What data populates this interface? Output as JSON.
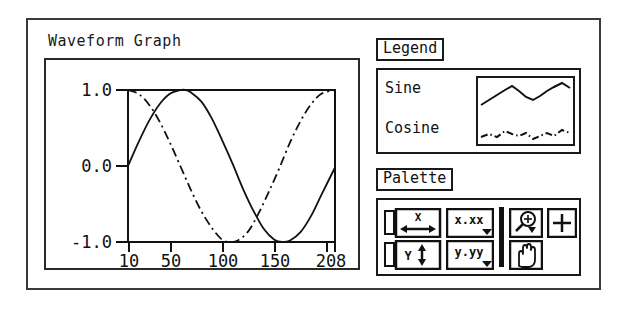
{
  "panel": {
    "background_color": "#ffffff",
    "border_color": "#3a3a3a"
  },
  "graph": {
    "title": "Waveform Graph"
  },
  "legend": {
    "tab_label": "Legend",
    "entries": [
      {
        "label": "Sine",
        "style": "solid"
      },
      {
        "label": "Cosine",
        "style": "dash-dot"
      }
    ]
  },
  "palette": {
    "tab_label": "Palette",
    "buttons": [
      {
        "name": "x-scale-lock",
        "label": "X",
        "icon": "x-horizontal-arrows-icon"
      },
      {
        "name": "x-format",
        "label": "x.xx",
        "icon": "x-format-dropdown-icon"
      },
      {
        "name": "zoom-tool",
        "label": "",
        "icon": "magnifier-plus-icon"
      },
      {
        "name": "cursor-tool",
        "label": "",
        "icon": "crosshair-icon"
      },
      {
        "name": "y-scale-lock",
        "label": "Y",
        "icon": "y-vertical-arrows-icon"
      },
      {
        "name": "y-format",
        "label": "y.yy",
        "icon": "y-format-dropdown-icon"
      },
      {
        "name": "pan-tool",
        "label": "",
        "icon": "hand-icon"
      }
    ]
  },
  "chart_data": {
    "type": "line",
    "title": "Waveform Graph",
    "xlabel": "",
    "ylabel": "",
    "xlim": [
      10,
      208
    ],
    "ylim": [
      -1.0,
      1.0
    ],
    "grid": false,
    "legend_position": "right",
    "xticks": [
      10,
      50,
      100,
      150,
      200,
      208
    ],
    "xtick_labels": [
      "10",
      "50",
      "100",
      "150",
      "208"
    ],
    "yticks": [
      -1.0,
      0.0,
      1.0
    ],
    "ytick_labels": [
      "1.0",
      "0.0",
      "-1.0"
    ],
    "series": [
      {
        "name": "Sine",
        "style": "solid",
        "x": [
          10,
          20,
          30,
          40,
          50,
          60,
          65,
          70,
          80,
          90,
          100,
          110,
          120,
          130,
          140,
          150,
          158,
          165,
          175,
          185,
          195,
          208
        ],
        "values": [
          0.0,
          0.31,
          0.59,
          0.81,
          0.95,
          1.0,
          1.0,
          0.97,
          0.85,
          0.63,
          0.34,
          0.03,
          -0.3,
          -0.59,
          -0.83,
          -0.97,
          -1.0,
          -0.98,
          -0.87,
          -0.66,
          -0.38,
          -0.02
        ]
      },
      {
        "name": "Cosine",
        "style": "dash-dot",
        "x": [
          10,
          20,
          30,
          40,
          50,
          60,
          70,
          80,
          90,
          100,
          108,
          115,
          125,
          135,
          145,
          155,
          165,
          175,
          185,
          195,
          208
        ],
        "values": [
          1.0,
          0.95,
          0.81,
          0.59,
          0.31,
          0.0,
          -0.31,
          -0.59,
          -0.81,
          -0.97,
          -1.0,
          -0.98,
          -0.86,
          -0.62,
          -0.33,
          -0.02,
          0.31,
          0.59,
          0.81,
          0.95,
          1.0
        ]
      }
    ]
  }
}
